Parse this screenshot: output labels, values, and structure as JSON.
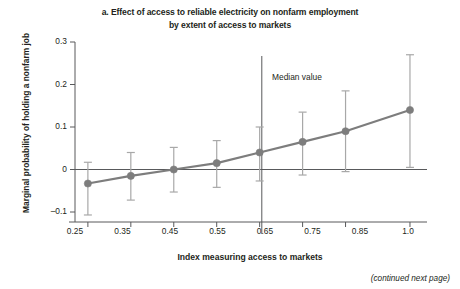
{
  "figure": {
    "title_line1": "a. Effect of access to reliable electricity on nonfarm employment",
    "title_line2": "by extent of access to markets",
    "continued_note": "(continued next page)"
  },
  "chart_data": {
    "type": "line",
    "title": "a. Effect of access to reliable electricity on nonfarm employment by extent of access to markets",
    "xlabel": "Index measuring access to markets",
    "ylabel": "Marginal probability of holding a nonfarm job",
    "x": [
      0.25,
      0.35,
      0.45,
      0.55,
      0.65,
      0.75,
      0.85,
      1.0
    ],
    "xtick_labels": [
      "0.25",
      "0.35",
      "0.45",
      "0.55",
      "0.65",
      "0.75",
      "0.85",
      "1.0"
    ],
    "ytick_labels": [
      "0.3",
      "0.2",
      "0.1",
      "0",
      "–0.1"
    ],
    "ytick_values": [
      0.3,
      0.2,
      0.1,
      0,
      -0.1
    ],
    "ylim": [
      -0.1,
      0.3
    ],
    "xlim": [
      0.22,
      1.035
    ],
    "grid": false,
    "legend": null,
    "series": [
      {
        "name": "Marginal probability of holding a nonfarm job",
        "values": [
          -0.033,
          -0.015,
          0.0,
          0.015,
          0.04,
          0.065,
          0.09,
          0.14
        ],
        "error_low": [
          -0.107,
          -0.072,
          -0.053,
          -0.042,
          -0.027,
          -0.013,
          -0.005,
          0.005
        ],
        "error_high": [
          0.017,
          0.04,
          0.052,
          0.068,
          0.1,
          0.135,
          0.185,
          0.27
        ],
        "marker": "circle",
        "color": "#7d7d7d"
      }
    ],
    "annotations": [
      {
        "name": "median-value",
        "label": "Median value",
        "x": 0.655,
        "type": "vertical-line"
      }
    ],
    "reference_lines": [
      {
        "name": "zero-line",
        "y": 0
      }
    ]
  },
  "colors": {
    "series": "#7d7d7d",
    "errorbar": "#a8a8a8",
    "axis": "#58595b",
    "text": "#231f20"
  }
}
